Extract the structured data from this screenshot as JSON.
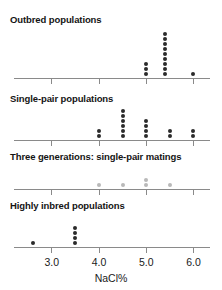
{
  "figure": {
    "axis_label": "NaCl%",
    "dot_color": "#2b2b2b",
    "dot_color_light": "#b9b9b9",
    "axis_color": "#8a8a8a"
  },
  "chart_data": {
    "type": "scatter",
    "title": "",
    "xlabel": "NaCl%",
    "ylabel": "",
    "xlim": [
      2.2,
      6.35
    ],
    "xticks": [
      3.0,
      4.0,
      5.0,
      6.0
    ],
    "xticklabels": [
      "3.0",
      "4.0",
      "5.0",
      "6.0"
    ],
    "grid": false,
    "legend": "none",
    "panels": [
      {
        "label": "Outbred populations",
        "dot_style": "dark",
        "stacks": [
          {
            "x": 5.0,
            "count": 3
          },
          {
            "x": 5.4,
            "count": 9
          },
          {
            "x": 6.0,
            "count": 1
          }
        ]
      },
      {
        "label": "Single-pair populations",
        "dot_style": "dark",
        "stacks": [
          {
            "x": 4.0,
            "count": 2
          },
          {
            "x": 4.5,
            "count": 6
          },
          {
            "x": 5.0,
            "count": 4
          },
          {
            "x": 5.5,
            "count": 2
          },
          {
            "x": 6.0,
            "count": 2
          }
        ]
      },
      {
        "label": "Three generations: single-pair matings",
        "dot_style": "light",
        "stacks": [
          {
            "x": 4.0,
            "count": 1
          },
          {
            "x": 4.5,
            "count": 1
          },
          {
            "x": 5.0,
            "count": 2
          },
          {
            "x": 5.5,
            "count": 1
          }
        ]
      },
      {
        "label": "Highly inbred populations",
        "dot_style": "dark",
        "stacks": [
          {
            "x": 2.6,
            "count": 1
          },
          {
            "x": 3.5,
            "count": 4
          }
        ]
      }
    ]
  }
}
